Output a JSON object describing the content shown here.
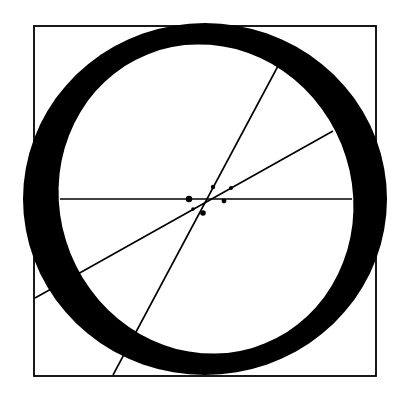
{
  "figure": {
    "width": 406,
    "height": 403,
    "colors": {
      "ink": "#000000",
      "paper": "#ffffff"
    },
    "square": {
      "x1": 34,
      "y1": 26,
      "x2": 376,
      "y2": 376,
      "stroke_width": 1.8
    },
    "letter_o": {
      "outer": {
        "cx": 205,
        "cy": 199,
        "rx": 182,
        "ry": 176
      },
      "inner": {
        "cx": 206,
        "cy": 199,
        "rx": 146,
        "ry": 156,
        "rotate": -22
      }
    },
    "construction_lines": [
      {
        "name": "horizontal-axis",
        "x1": 60,
        "y1": 199,
        "x2": 352,
        "y2": 199
      },
      {
        "name": "steep-diagonal",
        "x1": 113,
        "y1": 375,
        "x2": 278,
        "y2": 66
      },
      {
        "name": "shallow-diagonal",
        "x1": 35,
        "y1": 298,
        "x2": 333,
        "y2": 131
      }
    ],
    "points": [
      {
        "name": "point-left",
        "cx": 189,
        "cy": 199,
        "r": 3.2
      },
      {
        "name": "point-right",
        "cx": 224,
        "cy": 201,
        "r": 2.4
      },
      {
        "name": "point-upper",
        "cx": 213,
        "cy": 187,
        "r": 2.2
      },
      {
        "name": "point-upper-right",
        "cx": 231,
        "cy": 188,
        "r": 2.0
      },
      {
        "name": "point-lower",
        "cx": 203,
        "cy": 213,
        "r": 2.8
      },
      {
        "name": "point-lower-left",
        "cx": 193,
        "cy": 209,
        "r": 1.8
      }
    ]
  }
}
